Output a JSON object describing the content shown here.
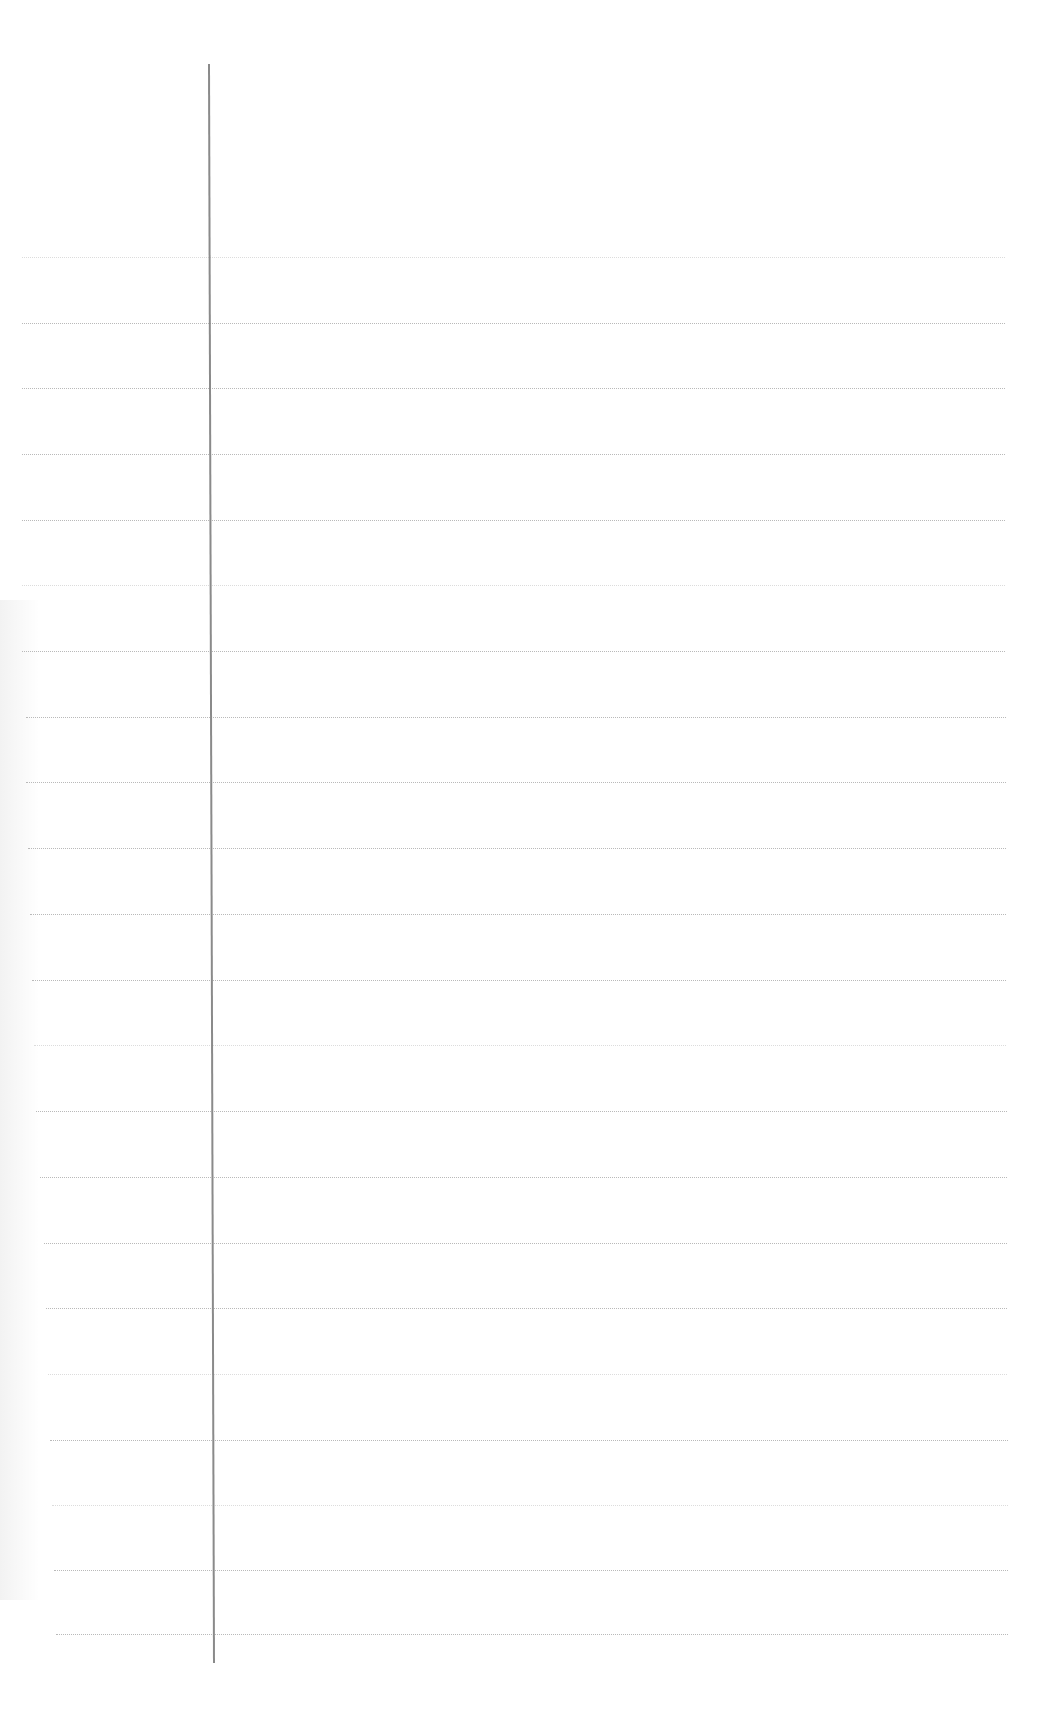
{
  "document": {
    "type": "ruled notebook paper",
    "content_text": "",
    "colors": {
      "paper": "#ffffff",
      "rule_line": "#b9b9b9",
      "margin_line": "#8a8a8a"
    },
    "rules": [
      {
        "y": 257,
        "x1": 22,
        "x2": 1005,
        "faint": true
      },
      {
        "y": 323,
        "x1": 22,
        "x2": 1005
      },
      {
        "y": 388,
        "x1": 22,
        "x2": 1005
      },
      {
        "y": 454,
        "x1": 22,
        "x2": 1005
      },
      {
        "y": 520,
        "x1": 22,
        "x2": 1005
      },
      {
        "y": 585,
        "x1": 22,
        "x2": 1005,
        "faint": true
      },
      {
        "y": 651,
        "x1": 22,
        "x2": 1005
      },
      {
        "y": 717,
        "x1": 26,
        "x2": 1006
      },
      {
        "y": 782,
        "x1": 26,
        "x2": 1006
      },
      {
        "y": 848,
        "x1": 28,
        "x2": 1006
      },
      {
        "y": 914,
        "x1": 30,
        "x2": 1006
      },
      {
        "y": 980,
        "x1": 32,
        "x2": 1006
      },
      {
        "y": 1045,
        "x1": 34,
        "x2": 1006,
        "faint": true
      },
      {
        "y": 1111,
        "x1": 36,
        "x2": 1007
      },
      {
        "y": 1177,
        "x1": 40,
        "x2": 1007
      },
      {
        "y": 1243,
        "x1": 44,
        "x2": 1007
      },
      {
        "y": 1308,
        "x1": 46,
        "x2": 1007
      },
      {
        "y": 1374,
        "x1": 48,
        "x2": 1007,
        "faint": true
      },
      {
        "y": 1440,
        "x1": 50,
        "x2": 1008
      },
      {
        "y": 1505,
        "x1": 52,
        "x2": 1008,
        "faint": true
      },
      {
        "y": 1570,
        "x1": 54,
        "x2": 1008
      },
      {
        "y": 1634,
        "x1": 56,
        "x2": 1008
      }
    ],
    "margin_line": {
      "x_top": 208,
      "x_bottom": 213,
      "y_top": 64,
      "y_bottom": 1663
    }
  }
}
